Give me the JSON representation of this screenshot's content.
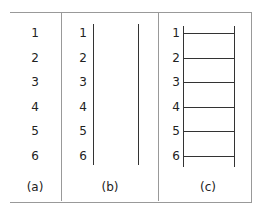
{
  "diagram": {
    "panels": [
      {
        "caption": "(a)",
        "labels": [
          "1",
          "2",
          "3",
          "4",
          "5",
          "6"
        ],
        "description": "numbered points only"
      },
      {
        "caption": "(b)",
        "labels": [
          "1",
          "2",
          "3",
          "4",
          "5",
          "6"
        ],
        "description": "numbered points with two vertical rails"
      },
      {
        "caption": "(c)",
        "labels": [
          "1",
          "2",
          "3",
          "4",
          "5",
          "6"
        ],
        "description": "ladder: two vertical rails with six rungs"
      }
    ]
  }
}
